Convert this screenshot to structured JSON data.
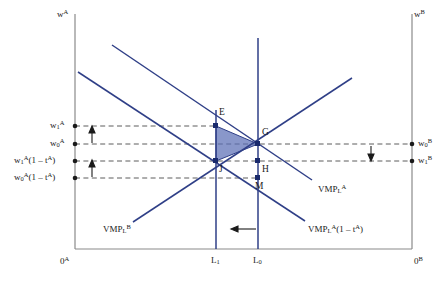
{
  "figure": {
    "title": "",
    "background_color": "#ffffff",
    "line_color": "#2f3f87",
    "axis_color": "#808080",
    "dash_color": "#555555",
    "shade_fill": "#5b6fb5",
    "shade_opacity": 0.72
  },
  "axes": {
    "left_axis_label": "w",
    "left_axis_sup": "A",
    "right_axis_label": "w",
    "right_axis_sup": "B",
    "origin_left": "0",
    "origin_left_sup": "A",
    "origin_right": "0",
    "origin_right_sup": "B"
  },
  "wage_labels_left": [
    {
      "id": "w1A",
      "base": "w",
      "sub": "1",
      "sup": "A",
      "suffix": "",
      "y": 126
    },
    {
      "id": "w0A",
      "base": "w",
      "sub": "0",
      "sup": "A",
      "suffix": "",
      "y": 144
    },
    {
      "id": "w1A_net",
      "base": "w",
      "sub": "1",
      "sup": "A",
      "suffix": "(1 – t",
      "y": 161
    },
    {
      "id": "w0A_net",
      "base": "w",
      "sub": "0",
      "sup": "A",
      "suffix": "(1 – t",
      "y": 178
    }
  ],
  "wage_labels_right": [
    {
      "id": "w0B",
      "base": "w",
      "sub": "0",
      "sup": "B",
      "y": 144
    },
    {
      "id": "w1B",
      "base": "w",
      "sub": "1",
      "sup": "B",
      "y": 161
    }
  ],
  "points": [
    {
      "name": "E",
      "label": "E",
      "x": 216,
      "y": 126
    },
    {
      "name": "G",
      "label": "G",
      "x": 258,
      "y": 144
    },
    {
      "name": "H",
      "label": "H",
      "x": 258,
      "y": 161
    },
    {
      "name": "J",
      "label": "J",
      "x": 216,
      "y": 161
    },
    {
      "name": "M",
      "label": "M",
      "x": 258,
      "y": 178
    }
  ],
  "point_labels": [
    {
      "text": "E",
      "x": 219,
      "y": 112
    },
    {
      "text": "G",
      "x": 262,
      "y": 131
    },
    {
      "text": "H",
      "x": 262,
      "y": 167
    },
    {
      "text": "J",
      "x": 219,
      "y": 167
    },
    {
      "text": "M",
      "x": 258,
      "y": 184
    }
  ],
  "curves": [
    {
      "name": "VMP_L_A",
      "label_base": "VMP",
      "label_sub": "L",
      "label_sup": "A",
      "label_suffix": "",
      "x": 318,
      "y": 188
    },
    {
      "name": "VMP_L_A_net",
      "label_base": "VMP",
      "label_sub": "L",
      "label_sup": "A",
      "label_suffix": "(1 – t",
      "x": 311,
      "y": 228
    },
    {
      "name": "VMP_L_B",
      "label_base": "VMP",
      "label_sub": "L",
      "label_sup": "B",
      "label_suffix": "",
      "x": 103,
      "y": 228
    }
  ],
  "x_ticks": [
    {
      "label": "L",
      "sub": "1",
      "x": 216,
      "y": 262
    },
    {
      "label": "L",
      "sub": "0",
      "x": 258,
      "y": 262
    }
  ],
  "annotations": [
    {
      "name": "labour-shift-arrow",
      "direction": "left",
      "x1": 255,
      "x2": 233,
      "y": 229
    },
    {
      "name": "left-arrow-upper",
      "direction": "up",
      "x": 92,
      "y1": 143,
      "y2": 129
    },
    {
      "name": "left-arrow-lower",
      "direction": "up",
      "x": 92,
      "y1": 177,
      "y2": 163
    },
    {
      "name": "right-arrow-down",
      "direction": "down",
      "x": 371,
      "y1": 146,
      "y2": 159
    }
  ],
  "superscript_t_close": ")"
}
